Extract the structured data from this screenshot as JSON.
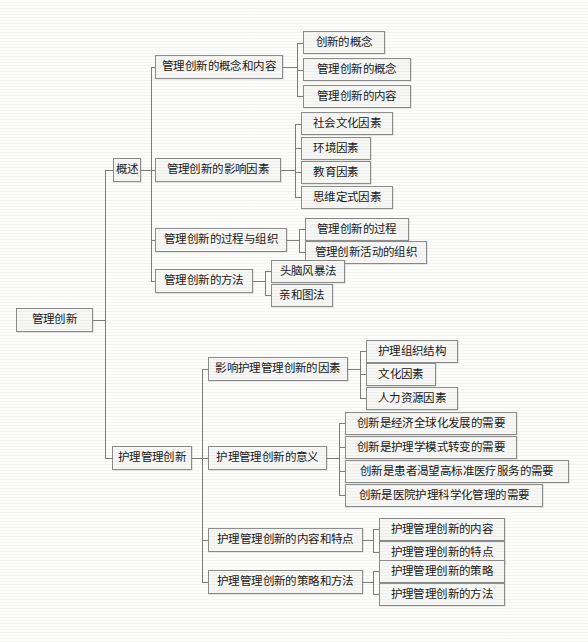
{
  "diagram": {
    "title": "管理创新",
    "type": "tree-mindmap",
    "root": {
      "label": "管理创新",
      "children": [
        {
          "label": "概述",
          "children": [
            {
              "label": "管理创新的概念和内容",
              "children": [
                {
                  "label": "创新的概念"
                },
                {
                  "label": "管理创新的概念"
                },
                {
                  "label": "管理创新的内容"
                }
              ]
            },
            {
              "label": "管理创新的影响因素",
              "children": [
                {
                  "label": "社会文化因素"
                },
                {
                  "label": "环境因素"
                },
                {
                  "label": "教育因素"
                },
                {
                  "label": "思维定式因素"
                }
              ]
            },
            {
              "label": "管理创新的过程与组织",
              "children": [
                {
                  "label": "管理创新的过程"
                },
                {
                  "label": "管理创新活动的组织"
                }
              ]
            },
            {
              "label": "管理创新的方法",
              "children": [
                {
                  "label": "头脑风暴法"
                },
                {
                  "label": "亲和图法"
                }
              ]
            }
          ]
        },
        {
          "label": "护理管理创新",
          "children": [
            {
              "label": "影响护理管理创新的因素",
              "children": [
                {
                  "label": "护理组织结构"
                },
                {
                  "label": "文化因素"
                },
                {
                  "label": "人力资源因素"
                }
              ]
            },
            {
              "label": "护理管理创新的意义",
              "children": [
                {
                  "label": "创新是经济全球化发展的需要"
                },
                {
                  "label": "创新是护理学模式转变的需要"
                },
                {
                  "label": "创新是患者渴望高标准医疗服务的需要"
                },
                {
                  "label": "创新是医院护理科学化管理的需要"
                }
              ]
            },
            {
              "label": "护理管理创新的内容和特点",
              "children": [
                {
                  "label": "护理管理创新的内容"
                },
                {
                  "label": "护理管理创新的特点"
                }
              ]
            },
            {
              "label": "护理管理创新的策略和方法",
              "children": [
                {
                  "label": "护理管理创新的策略"
                },
                {
                  "label": "护理管理创新的方法"
                }
              ]
            }
          ]
        }
      ]
    },
    "colors": {
      "box_border": "#8d8d8d",
      "box_fill": "#f7f7f5",
      "line": "#7e7e7e",
      "text": "#1a1a1a",
      "background": "#fdfdfc"
    }
  }
}
